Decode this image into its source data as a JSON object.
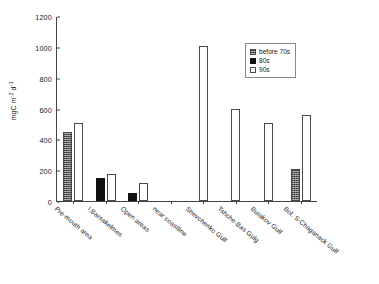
{
  "chart_data": {
    "type": "bar",
    "title": "",
    "subtitle": "",
    "xlabel": "",
    "ylabel": "mgC m-2 d-1",
    "ylabel_parts": {
      "base": "mgC m",
      "exp1": "-2",
      "mid": " d",
      "exp2": "-1"
    },
    "ylim": [
      0,
      1200
    ],
    "ytick_values": [
      0,
      200,
      400,
      600,
      800,
      1000,
      1200
    ],
    "ytick_labels": [
      "0",
      "200",
      "400",
      "600",
      "800",
      "1000",
      "1200"
    ],
    "grid": false,
    "legend_position": "upper right",
    "categories": [
      "Pre-mouth area",
      "I.Barsakelmes",
      "Open areas",
      "near coastline",
      "Shevchenko Gulf",
      "Tshche-Bas Gulg",
      "Butakov Gulf",
      "Bol. S-Chaganack Gulf"
    ],
    "series": [
      {
        "name": "before 70s",
        "fill": "stippled-gray",
        "color": "#5d5d5d",
        "values": [
          450,
          null,
          null,
          null,
          null,
          null,
          null,
          205
        ]
      },
      {
        "name": "80s",
        "fill": "solid-black",
        "color": "#111111",
        "values": [
          null,
          150,
          55,
          null,
          null,
          null,
          null,
          null
        ]
      },
      {
        "name": "90s",
        "fill": "white-outline",
        "color": "#ffffff",
        "values": [
          505,
          178,
          120,
          null,
          1005,
          600,
          505,
          555
        ]
      }
    ]
  },
  "legend": {
    "items": [
      {
        "label": "before 70s"
      },
      {
        "label": "80s"
      },
      {
        "label": "90s"
      }
    ]
  }
}
